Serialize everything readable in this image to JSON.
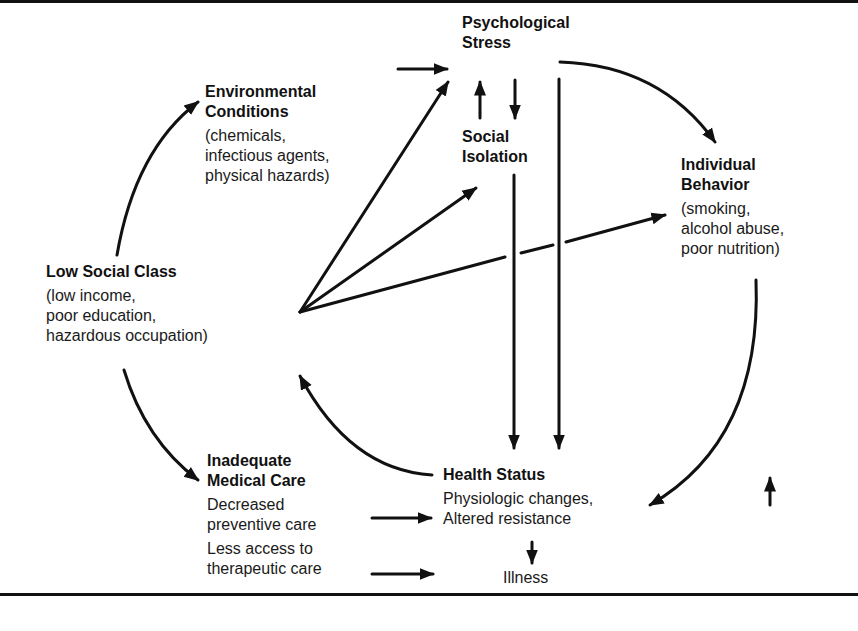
{
  "nodes": {
    "low_social_class": {
      "title": "Low Social Class",
      "lines": [
        "(low income,",
        "poor education,",
        "hazardous occupation)"
      ]
    },
    "environmental_conditions": {
      "title_lines": [
        "Environmental",
        "Conditions"
      ],
      "lines": [
        "(chemicals,",
        "infectious agents,",
        "physical hazards)"
      ]
    },
    "psychological_stress": {
      "title_lines": [
        "Psychological",
        "Stress"
      ]
    },
    "social_isolation": {
      "title_lines": [
        "Social",
        "Isolation"
      ]
    },
    "individual_behavior": {
      "title_lines": [
        "Individual",
        "Behavior"
      ],
      "lines": [
        "(smoking,",
        "alcohol abuse,",
        "poor nutrition)"
      ]
    },
    "inadequate_medical_care": {
      "title_lines": [
        "Inadequate",
        "Medical Care"
      ],
      "lines": [
        "Decreased",
        "preventive care",
        "Less access to",
        "therapeutic care"
      ]
    },
    "health_status": {
      "title": "Health Status",
      "lines": [
        "Physiologic changes,",
        "Altered resistance"
      ]
    },
    "illness": {
      "title": "Illness"
    }
  }
}
